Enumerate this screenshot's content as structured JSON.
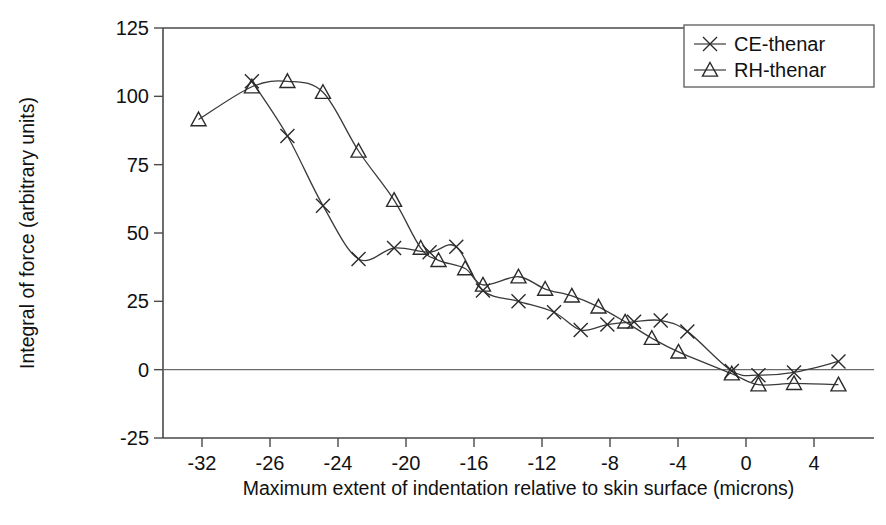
{
  "chart_data": {
    "type": "line",
    "title": "",
    "xlabel": "Maximum extent of indentation relative to skin surface (microns)",
    "ylabel": "Integral of force (arbitrary units)",
    "xlim": [
      -34,
      6
    ],
    "ylim": [
      -25,
      125
    ],
    "xticks": [
      -32,
      -26,
      -24,
      -20,
      -16,
      -12,
      -8,
      -4,
      0,
      4
    ],
    "xtick_labels": [
      "-32",
      "-26",
      "-24",
      "-20",
      "-16",
      "-12",
      "-8",
      "-4",
      "0",
      "4"
    ],
    "yticks": [
      -25,
      0,
      25,
      50,
      75,
      100,
      125
    ],
    "ytick_labels": [
      "-25",
      "0",
      "25",
      "50",
      "75",
      "100",
      "125"
    ],
    "grid": false,
    "legend_position": "top-right",
    "zero_reference_line": 0,
    "series": [
      {
        "name": "CE-thenar",
        "marker": "x",
        "color": "#2b2b2b",
        "points": [
          {
            "x": -29.0,
            "y": 105.5
          },
          {
            "x": -27.0,
            "y": 85.5
          },
          {
            "x": -25.0,
            "y": 60.0
          },
          {
            "x": -23.0,
            "y": 40.5
          },
          {
            "x": -21.0,
            "y": 44.5
          },
          {
            "x": -19.0,
            "y": 43.0
          },
          {
            "x": -17.5,
            "y": 45.0
          },
          {
            "x": -16.0,
            "y": 29.0
          },
          {
            "x": -14.0,
            "y": 25.0
          },
          {
            "x": -12.0,
            "y": 21.0
          },
          {
            "x": -10.5,
            "y": 14.5
          },
          {
            "x": -9.0,
            "y": 16.5
          },
          {
            "x": -7.5,
            "y": 17.5
          },
          {
            "x": -6.0,
            "y": 18.0
          },
          {
            "x": -4.5,
            "y": 14.0
          },
          {
            "x": -2.0,
            "y": -0.5
          },
          {
            "x": -0.5,
            "y": -2.0
          },
          {
            "x": 1.5,
            "y": -1.0
          },
          {
            "x": 4.0,
            "y": 3.0
          }
        ]
      },
      {
        "name": "RH-thenar",
        "marker": "triangle",
        "color": "#2b2b2b",
        "points": [
          {
            "x": -32.0,
            "y": 91.5
          },
          {
            "x": -29.0,
            "y": 103.5
          },
          {
            "x": -27.0,
            "y": 105.5
          },
          {
            "x": -25.0,
            "y": 101.5
          },
          {
            "x": -23.0,
            "y": 80.0
          },
          {
            "x": -21.0,
            "y": 62.0
          },
          {
            "x": -19.5,
            "y": 44.5
          },
          {
            "x": -18.5,
            "y": 40.0
          },
          {
            "x": -17.0,
            "y": 37.0
          },
          {
            "x": -16.0,
            "y": 31.0
          },
          {
            "x": -14.0,
            "y": 34.0
          },
          {
            "x": -12.5,
            "y": 29.5
          },
          {
            "x": -11.0,
            "y": 27.0
          },
          {
            "x": -9.5,
            "y": 23.0
          },
          {
            "x": -8.0,
            "y": 17.5
          },
          {
            "x": -6.5,
            "y": 11.5
          },
          {
            "x": -5.0,
            "y": 6.5
          },
          {
            "x": -2.0,
            "y": -1.5
          },
          {
            "x": -0.5,
            "y": -5.5
          },
          {
            "x": 1.5,
            "y": -5.0
          },
          {
            "x": 4.0,
            "y": -5.5
          }
        ]
      }
    ]
  },
  "legend": {
    "entries": [
      {
        "label": "CE-thenar",
        "marker": "x"
      },
      {
        "label": "RH-thenar",
        "marker": "triangle"
      }
    ]
  }
}
